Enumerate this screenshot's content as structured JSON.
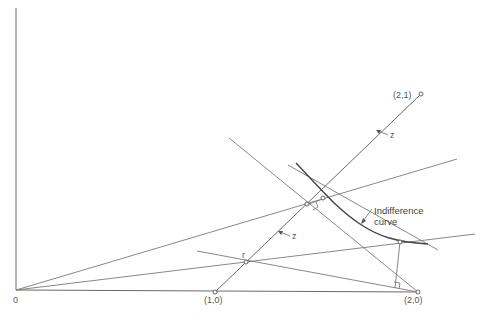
{
  "diagram": {
    "labels": {
      "origin": "0",
      "point_10": "(1,0)",
      "point_20": "(2,0)",
      "point_21": "(2,1)",
      "point_r": "r",
      "z_upper": "z",
      "z_lower": "z",
      "curve_line1": "Indifference",
      "curve_line2": "curve"
    },
    "colors": {
      "line": "#6a6a6a",
      "curve": "#444444",
      "text": "#555555",
      "background": "#ffffff"
    }
  }
}
